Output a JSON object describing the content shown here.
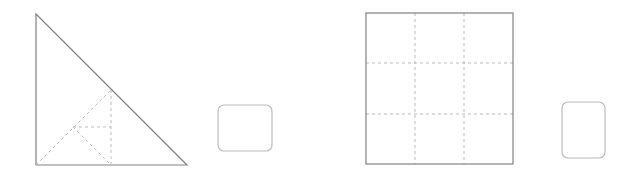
{
  "canvas": {
    "width": 628,
    "height": 180,
    "background": "#ffffff"
  },
  "style": {
    "solid_stroke": "#808080",
    "dashed_stroke": "#bbbbbb",
    "solid_width": 1.2,
    "dashed_width": 1,
    "dash_pattern": "3,3",
    "fill": "none"
  },
  "shapes": {
    "right_triangle": {
      "label": "right-triangle",
      "apex": {
        "x": 36,
        "y": 14
      },
      "bottom_left": {
        "x": 36,
        "y": 165
      },
      "bottom_right": {
        "x": 187,
        "y": 165
      },
      "points": "36,14 36,165 187,165",
      "stroke": "#808080"
    },
    "triangle_inner_vertical": {
      "label": "inner-vertical-dashed",
      "x1": 111,
      "y1": 90,
      "x2": 111,
      "y2": 165
    },
    "triangle_inner_hypotenuse": {
      "label": "inner-diagonal-dashed",
      "x1": 36,
      "y1": 165,
      "x2": 111,
      "y2": 90
    },
    "triangle_inner_horizontal": {
      "label": "inner-horizontal-dashed",
      "x1": 73,
      "y1": 127,
      "x2": 111,
      "y2": 127
    },
    "triangle_inner_small_diagonal": {
      "label": "inner-small-diagonal-dashed",
      "x1": 73,
      "y1": 127,
      "x2": 111,
      "y2": 165
    },
    "rounded_square_left": {
      "label": "rounded-square",
      "x": 218,
      "y": 105,
      "width": 54,
      "height": 46,
      "radius": 6,
      "stroke": "#bbbbbb"
    },
    "grid_square": {
      "label": "grid-square",
      "x": 366,
      "y": 13,
      "width": 147,
      "height": 151,
      "rows": 3,
      "columns": 3,
      "stroke": "#808080",
      "grid_stroke": "#bbbbbb",
      "vertical_gridlines": [
        415,
        464
      ],
      "horizontal_gridlines": [
        63,
        114
      ]
    },
    "rounded_rect_right": {
      "label": "rounded-rectangle",
      "x": 562,
      "y": 102,
      "width": 43,
      "height": 56,
      "radius": 6,
      "stroke": "#bbbbbb"
    }
  }
}
